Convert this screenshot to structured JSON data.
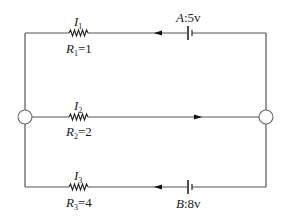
{
  "diagram": {
    "type": "circuit",
    "branches": [
      {
        "id": "top",
        "current_label": "I",
        "current_sub": "1",
        "resistor_label": "R",
        "resistor_sub": "1",
        "resistor_value": "=1",
        "source_name": "A",
        "source_value": ":5v",
        "current_direction": "left"
      },
      {
        "id": "middle",
        "current_label": "I",
        "current_sub": "2",
        "resistor_label": "R",
        "resistor_sub": "2",
        "resistor_value": "=2",
        "current_direction": "right"
      },
      {
        "id": "bottom",
        "current_label": "I",
        "current_sub": "3",
        "resistor_label": "R",
        "resistor_sub": "3",
        "resistor_value": "=4",
        "source_name": "B",
        "source_value": ":8v",
        "current_direction": "left"
      }
    ],
    "nodes": [
      "left-node",
      "right-node"
    ],
    "colors": {
      "wire": "#555555",
      "component": "#222222",
      "background": "#ffffff"
    }
  }
}
